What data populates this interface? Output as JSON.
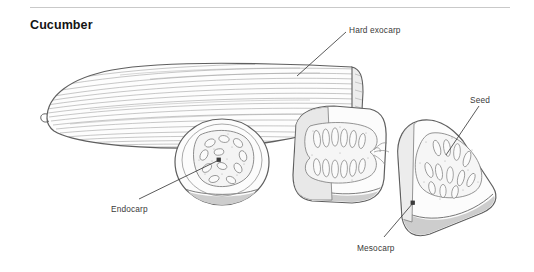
{
  "page": {
    "title": "Cucumber",
    "background_color": "#ffffff",
    "rule_color": "#c9c9c9"
  },
  "figure": {
    "name": "cucumber-anatomy-illustration",
    "style": "pen-and-ink line drawing, grayscale hatching",
    "ink_color": "#6f6f6f",
    "dark_ink_color": "#555555",
    "flesh_fill": "#fbfbfb",
    "rind_fill": "#d8d8d8",
    "parts": [
      {
        "name": "whole-fruit",
        "description": "whole cucumber with longitudinal striations, cut end at right"
      },
      {
        "name": "round-cross-section",
        "description": "transverse slice showing endocarp seed core"
      },
      {
        "name": "longitudinal-section",
        "description": "lengthwise cut piece showing two rows of seeds"
      },
      {
        "name": "wedge-section",
        "description": "quarter wedge showing seeds in mesocarp"
      }
    ]
  },
  "labels": [
    {
      "id": "hard-exocarp",
      "text": "Hard exocarp",
      "text_x": 349,
      "text_y": 25,
      "leader": {
        "x1": 346,
        "y1": 32,
        "x2": 297,
        "y2": 76
      },
      "marker": "none"
    },
    {
      "id": "seed",
      "text": "Seed",
      "text_x": 470,
      "text_y": 95,
      "leader": {
        "x1": 479,
        "y1": 106,
        "x2": 446,
        "y2": 155
      },
      "marker": "none"
    },
    {
      "id": "endocarp",
      "text": "Endocarp",
      "text_x": 111,
      "text_y": 204,
      "leader": {
        "x1": 139,
        "y1": 199,
        "x2": 219,
        "y2": 160
      },
      "marker": "dot"
    },
    {
      "id": "mesocarp",
      "text": "Mesocarp",
      "text_x": 357,
      "text_y": 243,
      "leader": {
        "x1": 384,
        "y1": 237,
        "x2": 413,
        "y2": 203
      },
      "marker": "dot"
    }
  ]
}
